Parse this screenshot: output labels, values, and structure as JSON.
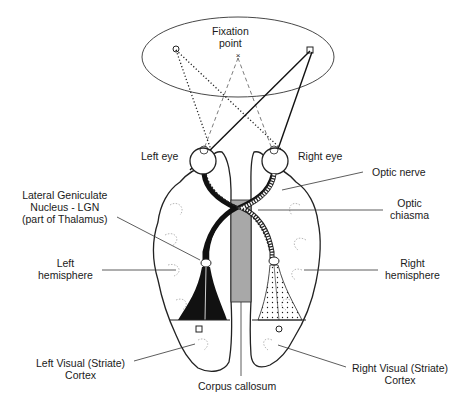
{
  "labels": {
    "fixation_point": [
      "Fixation",
      "point"
    ],
    "left_eye": "Left eye",
    "right_eye": "Right eye",
    "optic_nerve": "Optic nerve",
    "optic_chiasma": [
      "Optic",
      "chiasma"
    ],
    "lgn": [
      "Lateral Geniculate",
      "Nucleus - LGN",
      "(part of Thalamus)"
    ],
    "left_hemisphere": [
      "Left",
      "hemisphere"
    ],
    "right_hemisphere": [
      "Right",
      "hemisphere"
    ],
    "left_visual_cortex": [
      "Left Visual (Striate)",
      "Cortex"
    ],
    "right_visual_cortex": [
      "Right Visual (Striate)",
      "Cortex"
    ],
    "corpus_callosum": "Corpus callosum"
  },
  "markers": {
    "left_field_object": "circle",
    "fixation": "cross",
    "right_field_object": "square"
  },
  "colors": {
    "line": "#1a1a1a",
    "corpus_callosum_fill": "#a8a8a8",
    "left_pathway_fill": "#111111",
    "right_pathway_fill": "#ffffff"
  }
}
